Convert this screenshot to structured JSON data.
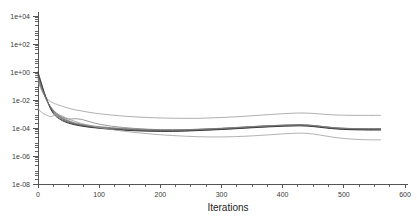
{
  "chart_data": {
    "type": "line",
    "title": "",
    "xlabel": "Iterations",
    "ylabel": "",
    "yscale": "log",
    "xlim": [
      0,
      600
    ],
    "ylim": [
      1e-08,
      10000.0
    ],
    "grid": false,
    "legend": "none",
    "x_ticks": [
      0,
      100,
      200,
      300,
      400,
      500,
      600
    ],
    "x_tick_labels": [
      "0",
      "100",
      "200",
      "300",
      "400",
      "500",
      "600"
    ],
    "x_minor_step": 25,
    "y_ticks": [
      10000,
      100,
      1,
      0.01,
      0.0001,
      1e-06,
      1e-08
    ],
    "y_tick_labels": [
      "1e+04",
      "1e+02",
      "1e+00",
      "1e-02",
      "1e-04",
      "1e-06",
      "1e-08"
    ],
    "y_minor_per_decade": 4,
    "colors": {
      "axis": "#555555",
      "text": "#1c1c1c",
      "series_light": "#9a9a9a",
      "series_mid": "#6f6f6f",
      "series_dark": "#3d3d3d"
    },
    "x": [
      0,
      5,
      10,
      15,
      20,
      25,
      30,
      40,
      50,
      60,
      70,
      80,
      90,
      100,
      120,
      140,
      160,
      180,
      200,
      220,
      240,
      260,
      280,
      300,
      320,
      340,
      360,
      380,
      400,
      420,
      430,
      440,
      450,
      460,
      470,
      480,
      490,
      500,
      510,
      520,
      530,
      540,
      550,
      560
    ],
    "series": [
      {
        "name": "upper-envelope",
        "color": "#9a9a9a",
        "width": 0.8,
        "values": [
          0.2,
          0.06,
          0.022,
          0.012,
          0.008,
          0.006,
          0.005,
          0.0035,
          0.0026,
          0.002,
          0.0017,
          0.0014,
          0.0012,
          0.00105,
          0.00085,
          0.0007,
          0.00062,
          0.00056,
          0.00052,
          0.0005,
          0.00049,
          0.00049,
          0.00052,
          0.00056,
          0.00062,
          0.0007,
          0.0008,
          0.00092,
          0.00105,
          0.00115,
          0.00118,
          0.00115,
          0.0011,
          0.00102,
          0.00094,
          0.00088,
          0.00084,
          0.00082,
          0.00081,
          0.0008,
          0.0008,
          0.0008,
          0.0008,
          0.0008
        ]
      },
      {
        "name": "bundle-1",
        "color": "#7a7a7a",
        "width": 0.8,
        "values": [
          0.5,
          0.1,
          0.025,
          0.008,
          0.0035,
          0.0018,
          0.0011,
          0.00055,
          0.00034,
          0.00024,
          0.00019,
          0.00016,
          0.00014,
          0.000125,
          0.000105,
          9.2e-05,
          8.4e-05,
          7.8e-05,
          7.5e-05,
          7.4e-05,
          7.6e-05,
          8e-05,
          8.6e-05,
          9.4e-05,
          0.000105,
          0.000118,
          0.000132,
          0.000146,
          0.000158,
          0.000166,
          0.000168,
          0.000162,
          0.00015,
          0.000135,
          0.00012,
          0.000108,
          0.0001,
          9.5e-05,
          9.2e-05,
          9e-05,
          8.9e-05,
          8.8e-05,
          8.8e-05,
          8.8e-05
        ]
      },
      {
        "name": "bundle-2",
        "color": "#6a6a6a",
        "width": 0.8,
        "values": [
          0.65,
          0.13,
          0.03,
          0.009,
          0.0032,
          0.0015,
          0.0009,
          0.00044,
          0.00028,
          0.0002,
          0.00016,
          0.000135,
          0.00012,
          0.000108,
          9e-05,
          8e-05,
          7.2e-05,
          6.8e-05,
          6.6e-05,
          6.6e-05,
          6.9e-05,
          7.3e-05,
          8e-05,
          8.8e-05,
          9.8e-05,
          0.00011,
          0.000124,
          0.000138,
          0.00015,
          0.000158,
          0.00016,
          0.000154,
          0.000142,
          0.000128,
          0.000114,
          0.000102,
          9.4e-05,
          8.9e-05,
          8.6e-05,
          8.4e-05,
          8.3e-05,
          8.2e-05,
          8.2e-05,
          8.2e-05
        ]
      },
      {
        "name": "bundle-3",
        "color": "#585858",
        "width": 0.9,
        "values": [
          0.8,
          0.16,
          0.034,
          0.0095,
          0.003,
          0.0013,
          0.00076,
          0.00038,
          0.00025,
          0.000185,
          0.00015,
          0.000128,
          0.000113,
          0.000102,
          8.6e-05,
          7.5e-05,
          6.8e-05,
          6.3e-05,
          6.1e-05,
          6.1e-05,
          6.4e-05,
          6.9e-05,
          7.5e-05,
          8.3e-05,
          9.2e-05,
          0.000104,
          0.000117,
          0.00013,
          0.000142,
          0.00015,
          0.000152,
          0.000146,
          0.000134,
          0.000121,
          0.000108,
          9.7e-05,
          8.9e-05,
          8.4e-05,
          8.1e-05,
          7.9e-05,
          7.8e-05,
          7.7e-05,
          7.7e-05,
          7.7e-05
        ]
      },
      {
        "name": "bundle-4-dark",
        "color": "#3d3d3d",
        "width": 1.0,
        "values": [
          1.0,
          0.19,
          0.036,
          0.009,
          0.0026,
          0.0011,
          0.00064,
          0.00033,
          0.00022,
          0.00017,
          0.00014,
          0.00012,
          0.000106,
          9.6e-05,
          8e-05,
          7e-05,
          6.3e-05,
          5.9e-05,
          5.7e-05,
          5.7e-05,
          6e-05,
          6.5e-05,
          7.1e-05,
          7.8e-05,
          8.7e-05,
          9.8e-05,
          0.00011,
          0.000122,
          0.000133,
          0.00014,
          0.000142,
          0.000137,
          0.000126,
          0.000113,
          0.000101,
          9.1e-05,
          8.4e-05,
          7.9e-05,
          7.6e-05,
          7.4e-05,
          7.3e-05,
          7.2e-05,
          7.2e-05,
          7.2e-05
        ]
      },
      {
        "name": "bundle-5",
        "color": "#6f6f6f",
        "width": 0.8,
        "values": [
          0.4,
          0.09,
          0.026,
          0.0085,
          0.0034,
          0.0017,
          0.001,
          0.00048,
          0.0003,
          0.00021,
          0.00017,
          0.000145,
          0.000128,
          0.000115,
          9.6e-05,
          8.4e-05,
          7.6e-05,
          7.1e-05,
          6.9e-05,
          6.9e-05,
          7.2e-05,
          7.7e-05,
          8.4e-05,
          9.2e-05,
          0.000102,
          0.000115,
          0.000129,
          0.000143,
          0.000155,
          0.000163,
          0.000165,
          0.000159,
          0.000147,
          0.000133,
          0.000119,
          0.000107,
          9.9e-05,
          9.4e-05,
          9.1e-05,
          8.9e-05,
          8.8e-05,
          8.7e-05,
          8.7e-05,
          8.7e-05
        ]
      },
      {
        "name": "bundle-6-bump",
        "color": "#7d7d7d",
        "width": 0.8,
        "values": [
          0.3,
          0.08,
          0.024,
          0.0082,
          0.0036,
          0.0019,
          0.0012,
          0.00062,
          0.00044,
          0.00046,
          0.00042,
          0.00032,
          0.00024,
          0.00019,
          0.000135,
          0.000108,
          9.2e-05,
          8.2e-05,
          7.6e-05,
          7.4e-05,
          7.6e-05,
          8.1e-05,
          8.8e-05,
          9.6e-05,
          0.000107,
          0.00012,
          0.000134,
          0.000148,
          0.00016,
          0.000168,
          0.00017,
          0.000164,
          0.000152,
          0.000137,
          0.000122,
          0.00011,
          0.000101,
          9.6e-05,
          9.3e-05,
          9.1e-05,
          9e-05,
          8.9e-05,
          8.9e-05,
          8.9e-05
        ]
      },
      {
        "name": "lower-envelope",
        "color": "#9e9e9e",
        "width": 0.8,
        "values": [
          0.0025,
          0.0014,
          0.001,
          0.0008,
          0.00065,
          0.00075,
          0.00095,
          0.0007,
          0.00044,
          0.0003,
          0.00022,
          0.00017,
          0.000135,
          0.00011,
          7.8e-05,
          5.9e-05,
          4.7e-05,
          3.9e-05,
          3.3e-05,
          2.9e-05,
          2.6e-05,
          2.4e-05,
          2.3e-05,
          2.3e-05,
          2.4e-05,
          2.6e-05,
          2.9e-05,
          3.3e-05,
          3.8e-05,
          4.2e-05,
          4.3e-05,
          4.1e-05,
          3.7e-05,
          3.2e-05,
          2.7e-05,
          2.3e-05,
          2e-05,
          1.8e-05,
          1.65e-05,
          1.55e-05,
          1.48e-05,
          1.44e-05,
          1.42e-05,
          1.42e-05
        ]
      }
    ]
  },
  "axis_titles": {
    "x": "Iterations"
  }
}
